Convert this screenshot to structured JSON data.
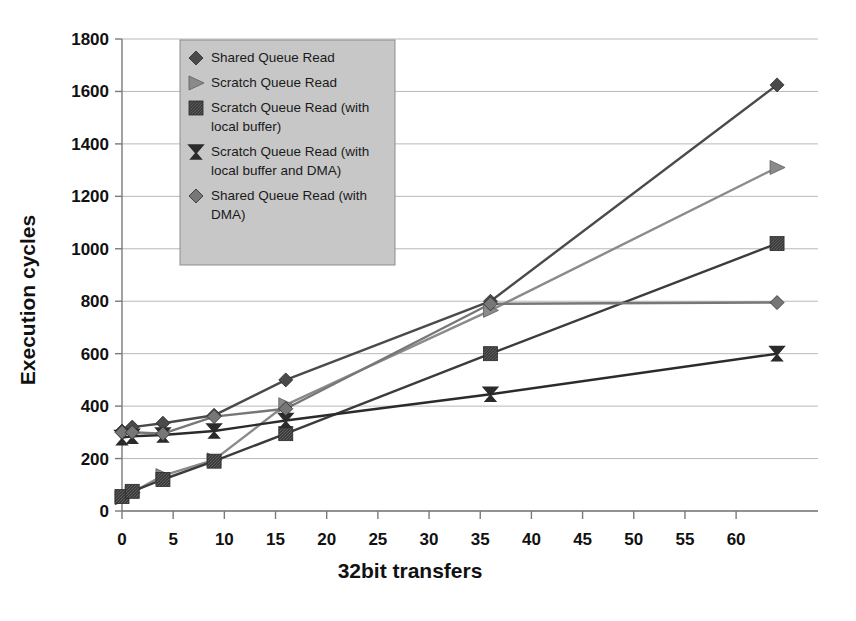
{
  "chart_data": {
    "type": "line",
    "title": "",
    "xlabel": "32bit transfers",
    "ylabel": "Execution cycles",
    "xlim": [
      0,
      68
    ],
    "ylim": [
      0,
      1800
    ],
    "xticks": [
      0,
      5,
      10,
      15,
      20,
      25,
      30,
      35,
      40,
      45,
      50,
      55,
      60
    ],
    "yticks": [
      0,
      200,
      400,
      600,
      800,
      1000,
      1200,
      1400,
      1600,
      1800
    ],
    "grid": "horizontal",
    "legend_position": "upper-left-inside",
    "x": [
      0,
      1,
      4,
      9,
      16,
      36,
      64
    ],
    "series": [
      {
        "name": "Shared Queue Read",
        "marker": "diamond",
        "color": "#4a4a4a",
        "values": [
          305,
          320,
          335,
          365,
          500,
          800,
          1625
        ]
      },
      {
        "name": "Scratch Queue Read",
        "marker": "triangle-right",
        "color": "#8a8a8a",
        "values": [
          50,
          70,
          135,
          195,
          405,
          765,
          1310
        ]
      },
      {
        "name": "Scratch Queue Read (with local buffer)",
        "marker": "square",
        "color": "#3c3c3c",
        "values": [
          55,
          75,
          120,
          190,
          295,
          600,
          1020
        ]
      },
      {
        "name": "Scratch Queue Read (with local buffer and DMA)",
        "marker": "hourglass-x",
        "color": "#2b2b2b",
        "values": [
          280,
          285,
          290,
          305,
          345,
          445,
          600
        ]
      },
      {
        "name": "Shared Queue Read (with DMA)",
        "marker": "diamond-light",
        "color": "#777777",
        "values": [
          300,
          300,
          295,
          360,
          390,
          790,
          795
        ]
      }
    ]
  },
  "legend": {
    "entries": [
      {
        "label_line1": "Shared Queue Read",
        "label_line2": ""
      },
      {
        "label_line1": "Scratch Queue Read",
        "label_line2": ""
      },
      {
        "label_line1": "Scratch Queue Read (with",
        "label_line2": "local buffer)"
      },
      {
        "label_line1": "Scratch Queue Read (with",
        "label_line2": "local buffer and DMA)"
      },
      {
        "label_line1": "Shared Queue Read (with",
        "label_line2": "DMA)"
      }
    ]
  },
  "axis_labels": {
    "y": "Execution cycles",
    "x": "32bit transfers"
  },
  "tick_labels": {
    "y": [
      "1800",
      "1600",
      "1400",
      "1200",
      "1000",
      "800",
      "600",
      "400",
      "200",
      "0"
    ],
    "x": [
      "0",
      "5",
      "10",
      "15",
      "20",
      "25",
      "30",
      "35",
      "40",
      "45",
      "50",
      "55",
      "60"
    ]
  }
}
